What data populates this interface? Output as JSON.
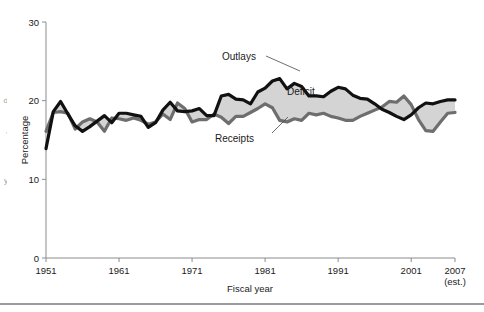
{
  "figure": {
    "background": "#ffffff",
    "bottom_rule_color": "#9b9b9b"
  },
  "margin_fragments": [
    {
      "text": "d",
      "top": 96
    },
    {
      "text": ",",
      "top": 126
    },
    {
      "text": "y",
      "top": 176
    }
  ],
  "labels": {
    "outlays": "Outlays",
    "receipts": "Receipts",
    "deficit": "Deficit"
  },
  "colors": {
    "outlays_line": "#111111",
    "receipts_line": "#6e6e6e",
    "deficit_fill": "#d4d4d4",
    "axis": "#8c8c8c",
    "text": "#1a1a1a",
    "leader": "#4a4a4a"
  },
  "chart_data": {
    "type": "area",
    "title": "",
    "subtitle": "",
    "xlabel": "Fiscal year",
    "ylabel": "Percentage",
    "xlim": [
      1951,
      2007
    ],
    "ylim": [
      0,
      30
    ],
    "grid": false,
    "legend_position": "inline-annotation",
    "xticks": [
      1951,
      1961,
      1971,
      1981,
      1991,
      2001,
      2007
    ],
    "xtick_labels": [
      "1951",
      "1961",
      "1971",
      "1981",
      "1991",
      "2001",
      "2007"
    ],
    "xtick_sublabels": [
      "",
      "",
      "",
      "",
      "",
      "",
      "(est.)"
    ],
    "yticks": [
      0,
      10,
      20,
      30
    ],
    "ytick_labels": [
      "0",
      "10",
      "20",
      "30"
    ],
    "annotations": [
      {
        "text": "Outlays",
        "target": "outlays-series"
      },
      {
        "text": "Receipts",
        "target": "receipts-series"
      },
      {
        "text": "Deficit",
        "target": "shaded-gap"
      }
    ],
    "x": [
      1951,
      1952,
      1953,
      1954,
      1955,
      1956,
      1957,
      1958,
      1959,
      1960,
      1961,
      1962,
      1963,
      1964,
      1965,
      1966,
      1967,
      1968,
      1969,
      1970,
      1971,
      1972,
      1973,
      1974,
      1975,
      1976,
      1977,
      1978,
      1979,
      1980,
      1981,
      1982,
      1983,
      1984,
      1985,
      1986,
      1987,
      1988,
      1989,
      1990,
      1991,
      1992,
      1993,
      1994,
      1995,
      1996,
      1997,
      1998,
      1999,
      2000,
      2001,
      2002,
      2003,
      2004,
      2005,
      2006,
      2007
    ],
    "series": [
      {
        "name": "Outlays",
        "color": "#111111",
        "values": [
          13.9,
          18.6,
          19.9,
          18.3,
          16.8,
          16.1,
          16.7,
          17.4,
          18.1,
          17.2,
          18.4,
          18.4,
          18.2,
          18.0,
          16.6,
          17.2,
          18.8,
          19.8,
          18.7,
          18.6,
          18.7,
          19.0,
          18.1,
          18.1,
          20.6,
          20.8,
          20.2,
          20.1,
          19.6,
          21.1,
          21.6,
          22.5,
          22.8,
          21.5,
          22.2,
          21.8,
          20.6,
          20.6,
          20.5,
          21.2,
          21.7,
          21.5,
          20.7,
          20.3,
          20.2,
          19.6,
          18.9,
          18.5,
          18.0,
          17.6,
          18.2,
          19.1,
          19.7,
          19.6,
          19.9,
          20.1,
          20.1
        ]
      },
      {
        "name": "Receipts",
        "color": "#6e6e6e",
        "values": [
          16.1,
          18.5,
          18.6,
          18.4,
          16.4,
          17.3,
          17.7,
          17.3,
          16.1,
          17.8,
          17.7,
          17.5,
          17.8,
          17.5,
          17.0,
          17.3,
          18.3,
          17.6,
          19.7,
          19.0,
          17.3,
          17.6,
          17.6,
          18.3,
          17.9,
          17.1,
          18.0,
          18.0,
          18.5,
          19.0,
          19.6,
          19.1,
          17.5,
          17.3,
          17.7,
          17.5,
          18.4,
          18.2,
          18.4,
          18.0,
          17.8,
          17.5,
          17.5,
          18.0,
          18.4,
          18.8,
          19.2,
          19.9,
          19.8,
          20.6,
          19.5,
          17.6,
          16.2,
          16.1,
          17.3,
          18.4,
          18.5
        ]
      }
    ]
  }
}
